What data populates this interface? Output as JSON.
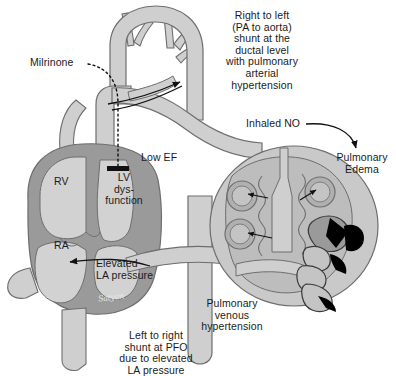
{
  "figure": {
    "signature": "Satyan",
    "colors": {
      "background": "#ffffff",
      "vessel_fill": "#cfcfcf",
      "vessel_stroke": "#6e6e6e",
      "chamber_fill": "#d2d2d2",
      "myocardium_fill": "#9a9a9a",
      "lung_fill": "#c9c9c9",
      "lung_inner": "#bdbdbd",
      "alveolus_fill": "#b0b0b0",
      "bronchus_lumen": "#000000",
      "text": "#1a1a1a",
      "arrow": "#111111"
    }
  },
  "labels": {
    "shunt_ductal": "Right to left\n(PA to aorta)\nshunt at the\nductal level\nwith pulmonary\narterial\nhypertension",
    "milrinone": "Milrinone",
    "inhaled_no": "Inhaled NO",
    "pulmonary_edema": "Pulmonary\nEdema",
    "low_ef": "Low EF",
    "rv": "RV",
    "lv_dysfunction": "LV\ndys-\nfunction",
    "ra": "RA",
    "elevated_la_pressure": "Elevated\nLA pressure",
    "pulmonary_venous_hypertension": "Pulmonary\nvenous\nhypertension",
    "pfo_shunt": "Left to right\nshunt at PFO\ndue to elevated\nLA pressure"
  },
  "anatomy": {
    "chambers": [
      "RV",
      "LV",
      "RA",
      "LA"
    ],
    "great_vessels": [
      "aortic arch",
      "brachiocephalic branches",
      "main pulmonary artery",
      "ductus arteriosus",
      "pulmonary veins",
      "superior vena cava",
      "inferior vena cava"
    ],
    "lung_features": [
      "alveoli",
      "bronchial tree",
      "pulmonary vasculature"
    ],
    "alveoli_count": 3
  },
  "annotations": {
    "ductal_shunt_arrow": "curved arrow from pulmonary artery to aorta (right to left)",
    "milrinone_arrow": "dotted curve from Milrinone label to black block on left ventricle",
    "inhaled_no_arrow": "curved arrow from Inhaled NO toward Pulmonary Edema",
    "la_pressure_arrow": "arrow from pulmonary veins into right atrium across PFO",
    "alveolar_arrows": "three arrows pointing into alveoli indicating edema fluid"
  }
}
